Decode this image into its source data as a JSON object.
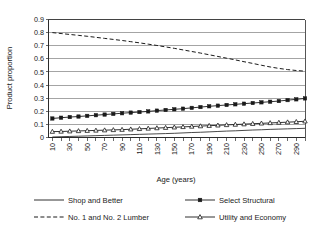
{
  "chart_data": {
    "type": "line",
    "title": "",
    "xlabel": "Age (years)",
    "ylabel": "Product proportion",
    "xlim": [
      5,
      300
    ],
    "ylim": [
      0,
      0.9
    ],
    "ytick_labels": [
      "0",
      "0.1",
      "0.2",
      "0.3",
      "0.4",
      "0.5",
      "0.6",
      "0.7",
      "0.8",
      "0.9"
    ],
    "ytick_values": [
      0,
      0.1,
      0.2,
      0.3,
      0.4,
      0.5,
      0.6,
      0.7,
      0.8,
      0.9
    ],
    "xtick_labels": [
      "10",
      "30",
      "50",
      "70",
      "90",
      "110",
      "130",
      "150",
      "170",
      "190",
      "210",
      "230",
      "250",
      "270",
      "290"
    ],
    "xtick_values": [
      10,
      30,
      50,
      70,
      90,
      110,
      130,
      150,
      170,
      190,
      210,
      230,
      250,
      270,
      290
    ],
    "x": [
      10,
      20,
      30,
      40,
      50,
      60,
      70,
      80,
      90,
      100,
      110,
      120,
      130,
      140,
      150,
      160,
      170,
      180,
      190,
      200,
      210,
      220,
      230,
      240,
      250,
      260,
      270,
      280,
      290,
      300
    ],
    "grid": "horizontal",
    "legend_position": "bottom",
    "series": [
      {
        "name": "Shop and Better",
        "style": "solid",
        "marker": "none",
        "values": [
          0.004,
          0.006,
          0.008,
          0.01,
          0.012,
          0.014,
          0.016,
          0.018,
          0.02,
          0.022,
          0.024,
          0.026,
          0.028,
          0.03,
          0.032,
          0.035,
          0.038,
          0.04,
          0.043,
          0.046,
          0.049,
          0.051,
          0.054,
          0.057,
          0.059,
          0.062,
          0.064,
          0.066,
          0.068,
          0.07
        ]
      },
      {
        "name": "Select Structural",
        "style": "solid",
        "marker": "square",
        "values": [
          0.145,
          0.151,
          0.156,
          0.16,
          0.165,
          0.17,
          0.175,
          0.18,
          0.185,
          0.19,
          0.194,
          0.199,
          0.205,
          0.21,
          0.215,
          0.22,
          0.226,
          0.232,
          0.238,
          0.243,
          0.248,
          0.253,
          0.258,
          0.263,
          0.268,
          0.273,
          0.278,
          0.285,
          0.291,
          0.298
        ]
      },
      {
        "name": "No. 1 and No. 2 Lumber",
        "style": "dashed",
        "marker": "none",
        "values": [
          0.8,
          0.793,
          0.786,
          0.779,
          0.772,
          0.764,
          0.756,
          0.748,
          0.74,
          0.731,
          0.722,
          0.712,
          0.702,
          0.691,
          0.68,
          0.668,
          0.656,
          0.644,
          0.631,
          0.618,
          0.605,
          0.592,
          0.578,
          0.565,
          0.551,
          0.538,
          0.527,
          0.518,
          0.511,
          0.506
        ]
      },
      {
        "name": "Utility and Economy",
        "style": "solid",
        "marker": "triangle",
        "values": [
          0.045,
          0.046,
          0.048,
          0.05,
          0.052,
          0.054,
          0.056,
          0.058,
          0.06,
          0.063,
          0.066,
          0.069,
          0.072,
          0.075,
          0.078,
          0.081,
          0.084,
          0.087,
          0.09,
          0.093,
          0.096,
          0.099,
          0.102,
          0.105,
          0.108,
          0.111,
          0.114,
          0.117,
          0.12,
          0.124
        ]
      }
    ]
  },
  "legend": {
    "entries": [
      {
        "label": "Shop and Better"
      },
      {
        "label": "Select Structural"
      },
      {
        "label": "No. 1 and No. 2 Lumber"
      },
      {
        "label": "Utility and Economy"
      }
    ]
  },
  "colors": {
    "line": "#1a1a1a",
    "grid": "#7d7d7d",
    "axis": "#2b2b2b",
    "background": "#ffffff"
  }
}
